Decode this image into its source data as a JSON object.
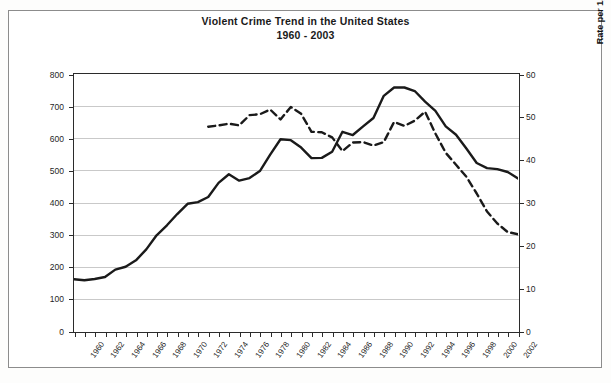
{
  "title": {
    "line1": "Violent Crime Trend in the United States",
    "line2": "1960 - 2003"
  },
  "chart_data": {
    "type": "line",
    "title": "Violent Crime Trend in the United States 1960 - 2003",
    "xlabel": "",
    "ylabel": "Rate per 100,000 Population (UCR)",
    "y2label": "Rate per 1,000 Population Age 12 & Up (NCVS)",
    "grid": true,
    "legend": "none",
    "xlim": [
      1960,
      2003
    ],
    "ylim": [
      0,
      800
    ],
    "y2lim": [
      0,
      60
    ],
    "yticks": [
      0,
      100,
      200,
      300,
      400,
      500,
      600,
      700,
      800
    ],
    "y2ticks": [
      0,
      10,
      20,
      30,
      40,
      50,
      60
    ],
    "xticks": [
      1960,
      1962,
      1964,
      1966,
      1968,
      1970,
      1972,
      1974,
      1976,
      1978,
      1980,
      1982,
      1984,
      1986,
      1988,
      1990,
      1992,
      1994,
      1996,
      1998,
      2000,
      2002
    ],
    "series": [
      {
        "name": "Rate per 100,000 Population (UCR)",
        "axis": "left",
        "style": "solid",
        "color": "#1a1a1a",
        "x": [
          1960,
          1961,
          1962,
          1963,
          1964,
          1965,
          1966,
          1967,
          1968,
          1969,
          1970,
          1971,
          1972,
          1973,
          1974,
          1975,
          1976,
          1977,
          1978,
          1979,
          1980,
          1981,
          1982,
          1983,
          1984,
          1985,
          1986,
          1987,
          1988,
          1989,
          1990,
          1991,
          1992,
          1993,
          1994,
          1995,
          1996,
          1997,
          1998,
          1999,
          2000,
          2001,
          2002,
          2003
        ],
        "values": [
          161,
          158,
          162,
          168,
          191,
          200,
          220,
          254,
          298,
          329,
          364,
          396,
          401,
          417,
          461,
          488,
          468,
          476,
          498,
          549,
          597,
          594,
          571,
          538,
          539,
          558,
          620,
          610,
          637,
          663,
          732,
          758,
          758,
          747,
          714,
          685,
          637,
          611,
          568,
          523,
          507,
          504,
          495,
          475
        ]
      },
      {
        "name": "Rate per 1,000 Population Age 12 & Up (NCVS)",
        "axis": "right",
        "style": "dashed",
        "color": "#1a1a1a",
        "x": [
          1973,
          1974,
          1975,
          1976,
          1977,
          1978,
          1979,
          1980,
          1981,
          1982,
          1983,
          1984,
          1985,
          1986,
          1987,
          1988,
          1989,
          1990,
          1991,
          1992,
          1993,
          1994,
          1995,
          1996,
          1997,
          1998,
          1999,
          2000,
          2001,
          2002,
          2003
        ],
        "values": [
          47.7,
          48.0,
          48.4,
          48.0,
          50.4,
          50.6,
          51.7,
          49.4,
          52.3,
          50.7,
          46.5,
          46.4,
          45.2,
          42.0,
          44.0,
          44.1,
          43.3,
          44.1,
          48.8,
          47.9,
          49.1,
          51.2,
          46.1,
          41.6,
          38.8,
          36.0,
          32.1,
          27.9,
          25.1,
          23.1,
          22.6
        ]
      }
    ]
  },
  "axes": {
    "left_ticks": [
      "800",
      "700",
      "600",
      "500",
      "400",
      "300",
      "200",
      "100",
      "0"
    ],
    "right_ticks": [
      "60",
      "50",
      "40",
      "30",
      "20",
      "10",
      "0"
    ],
    "left_title": "Rate per 100,000 Population (UCR)",
    "right_title": "Rate per 1,000 Population Age 12 & Up (NCVS)",
    "x_labels": [
      "1960",
      "1962",
      "1964",
      "1966",
      "1968",
      "1970",
      "1972",
      "1974",
      "1976",
      "1978",
      "1980",
      "1982",
      "1984",
      "1986",
      "1988",
      "1990",
      "1992",
      "1994",
      "1996",
      "1998",
      "2000",
      "2002"
    ]
  },
  "colors": {
    "line": "#1a1a1a",
    "grid": "#c9c9c9",
    "axis": "#2b2b2b",
    "frame": "#8c8c8c",
    "background": "#ffffff"
  }
}
